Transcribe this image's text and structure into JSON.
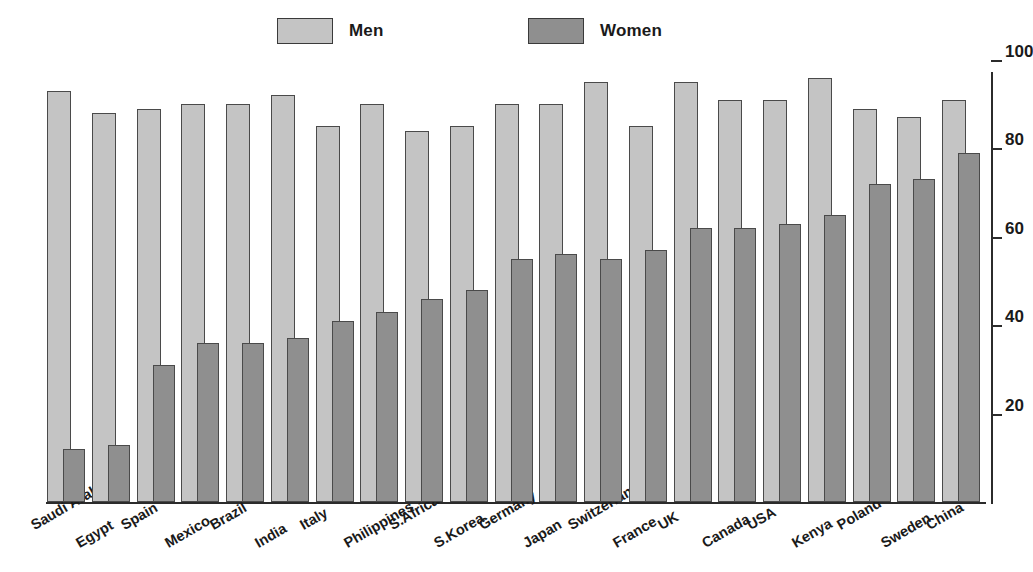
{
  "legend": {
    "entries": [
      {
        "label": "Men",
        "color": "#c4c4c4"
      },
      {
        "label": "Women",
        "color": "#8f8f8f"
      }
    ]
  },
  "axis": {
    "ticks": [
      "100",
      "80",
      "60",
      "40",
      "20"
    ],
    "tick_values": [
      100,
      80,
      60,
      40,
      20
    ],
    "min": 0,
    "max": 100
  },
  "chart_data": {
    "type": "bar",
    "title": "",
    "subtitle": "",
    "xlabel": "",
    "ylabel": "",
    "ylim": [
      0,
      100
    ],
    "yticks": [
      20,
      40,
      60,
      80,
      100
    ],
    "grid": false,
    "legend_position": "top",
    "orientation": "vertical",
    "grouping": "overlapping-pairs",
    "categories": [
      "Saudi Arabia",
      "Egypt",
      "Spain",
      "Mexico",
      "Brazil",
      "India",
      "Italy",
      "Philippines",
      "S.Africa",
      "S.Korea",
      "Germany",
      "Japan",
      "Switzerland",
      "France",
      "UK",
      "Canada",
      "USA",
      "Kenya",
      "Poland",
      "Sweden",
      "China"
    ],
    "series": [
      {
        "name": "Men",
        "color": "#c4c4c4",
        "values": [
          93,
          88,
          89,
          90,
          90,
          92,
          85,
          90,
          84,
          85,
          90,
          90,
          95,
          85,
          95,
          91,
          91,
          96,
          89,
          87,
          91
        ]
      },
      {
        "name": "Women",
        "color": "#8f8f8f",
        "values": [
          12,
          13,
          31,
          36,
          36,
          37,
          41,
          43,
          46,
          48,
          55,
          56,
          55,
          57,
          62,
          62,
          63,
          65,
          72,
          73,
          79
        ]
      }
    ]
  }
}
